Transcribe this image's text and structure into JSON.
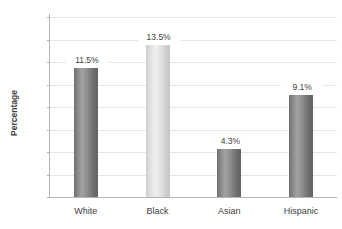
{
  "chart_data": {
    "type": "bar",
    "title": "",
    "xlabel": "",
    "ylabel": "Percentage",
    "ylim": [
      0,
      16
    ],
    "ytick_step": 2,
    "yticks": [
      "16",
      "14",
      "12",
      "10",
      "8",
      "6",
      "4",
      "2",
      "0"
    ],
    "grid": true,
    "legend": "none",
    "categories": [
      "White",
      "Black",
      "Asian",
      "Hispanic"
    ],
    "values": [
      11.5,
      13.5,
      4.3,
      9.1
    ],
    "value_labels": [
      "11.5%",
      "13.5%",
      "4.3%",
      "9.1%"
    ],
    "bar_colors": [
      "#7a7a7a",
      "#dcdcdc",
      "#7a7a7a",
      "#7a7a7a"
    ]
  },
  "axis": {
    "y_title": "Percentage"
  },
  "colors": {
    "background": "#ffffff",
    "gridline": "#e6e6e6",
    "axis_line": "#b5b5b5",
    "text": "#3d3d3d",
    "bar_dark": "#7a7a7a",
    "bar_light": "#dcdcdc"
  }
}
